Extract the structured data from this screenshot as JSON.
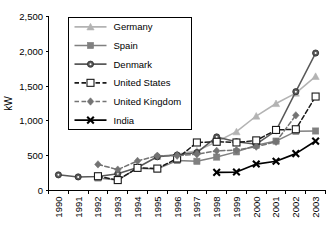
{
  "chart_data": {
    "type": "line",
    "title": "",
    "xlabel": "",
    "ylabel": "kW",
    "ylim": [
      0,
      2500
    ],
    "yticks": [
      0,
      500,
      1000,
      1500,
      2000,
      2500
    ],
    "ytick_labels": [
      "0",
      "500",
      "1,000",
      "1,500",
      "2,000",
      "2,500"
    ],
    "grid": false,
    "legend_position": "upper-left-inside",
    "categories": [
      "1990",
      "1991",
      "1992",
      "1993",
      "1994",
      "1995",
      "1996",
      "1997",
      "1998",
      "1999",
      "2000",
      "2001",
      "2002",
      "2003"
    ],
    "series": [
      {
        "name": "Germany",
        "color": "#b3b3b3",
        "marker": "triangle",
        "dashed": false,
        "values": [
          null,
          null,
          null,
          null,
          null,
          490,
          520,
          570,
          700,
          845,
          1070,
          1250,
          1400,
          1640
        ]
      },
      {
        "name": "Spain",
        "color": "#808080",
        "marker": "square",
        "dashed": false,
        "values": [
          null,
          null,
          180,
          150,
          320,
          310,
          430,
          420,
          480,
          555,
          650,
          710,
          850,
          855
        ]
      },
      {
        "name": "Denmark",
        "color": "#595959",
        "marker": "circle",
        "dashed": false,
        "values": [
          225,
          195,
          200,
          240,
          330,
          485,
          510,
          545,
          770,
          700,
          665,
          860,
          1420,
          1975
        ]
      },
      {
        "name": "United States",
        "color": "#1a1a1a",
        "marker": "open-square",
        "dashed": true,
        "values": [
          null,
          null,
          205,
          150,
          325,
          315,
          460,
          690,
          700,
          690,
          720,
          870,
          880,
          1350
        ]
      },
      {
        "name": "United Kingdom",
        "color": "#737373",
        "marker": "diamond",
        "dashed": true,
        "values": [
          null,
          null,
          375,
          300,
          425,
          500,
          500,
          520,
          570,
          580,
          630,
          700,
          1080,
          null
        ]
      },
      {
        "name": "India",
        "color": "#000000",
        "marker": "x",
        "dashed": false,
        "values": [
          null,
          null,
          null,
          null,
          null,
          null,
          null,
          null,
          260,
          265,
          380,
          420,
          530,
          710
        ]
      }
    ]
  }
}
